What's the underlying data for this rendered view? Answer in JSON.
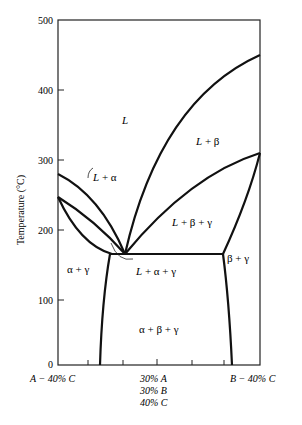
{
  "chart_data": {
    "type": "line",
    "title": "",
    "subtitle": "Vertical section (isopleth) of ternary A-B-C phase diagram at 40% C",
    "xlabel": "",
    "ylabel": "Temperature (°C)",
    "ylim": [
      0,
      500
    ],
    "yticks": [
      0,
      100,
      200,
      300,
      400,
      500
    ],
    "grid": false,
    "x_left_label": "A − 40% C",
    "x_right_label": "B − 40% C",
    "x_mid_label": [
      "30% A",
      "30% B",
      "40% C"
    ],
    "x_ticks_fraction": [
      0.15,
      0.32,
      0.49,
      0.66,
      0.82
    ],
    "key_points": {
      "left_liquidus_start_C": 280,
      "left_solidus_start_C": 250,
      "right_liquidus_end_C": 450,
      "right_second_boundary_end_C": 310,
      "invariant_line_C": 160
    },
    "regions": [
      {
        "label": "L",
        "x": 0.33,
        "y": 360
      },
      {
        "label": "L + α",
        "x": 0.27,
        "y": 265
      },
      {
        "label": "L + β",
        "x": 0.73,
        "y": 335
      },
      {
        "label": "L + β + γ",
        "x": 0.65,
        "y": 205
      },
      {
        "label": "α + γ",
        "x": 0.08,
        "y": 148
      },
      {
        "label": "L + α + γ",
        "x": 0.45,
        "y": 143
      },
      {
        "label": "β + γ",
        "x": 0.9,
        "y": 160
      },
      {
        "label": "α + β + γ",
        "x": 0.48,
        "y": 62
      }
    ]
  },
  "axis": {
    "ylabel": "Temperature (°C)",
    "yticks": [
      "500",
      "400",
      "300",
      "200",
      "100",
      "0"
    ],
    "x_left": "A − 40% C",
    "x_right": "B − 40% C",
    "x_mid_1": "30% A",
    "x_mid_2": "30% B",
    "x_mid_3": "40% C"
  },
  "labels": {
    "L": "L",
    "L_alpha": "L + α",
    "L_beta": "L + β",
    "L_beta_gamma": "L + β + γ",
    "alpha_gamma": "α + γ",
    "L_alpha_gamma": "L + α + γ",
    "beta_gamma": "β + γ",
    "alpha_beta_gamma": "α + β + γ"
  }
}
